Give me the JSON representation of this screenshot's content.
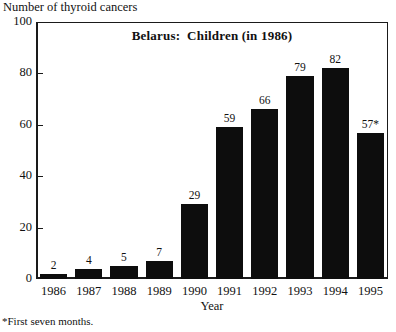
{
  "figure": {
    "y_axis_caption": "Number of thyroid cancers",
    "x_axis_title": "Year",
    "footnote": "*First seven months."
  },
  "chart_data": {
    "type": "bar",
    "title": "Belarus:  Children (in 1986)",
    "xlabel": "Year",
    "ylabel": "Number of thyroid cancers",
    "ylim": [
      0,
      100
    ],
    "yticks": [
      0,
      20,
      40,
      60,
      80,
      100
    ],
    "ytick_labels": [
      "0",
      "20",
      "40",
      "60",
      "80",
      "100"
    ],
    "grid": false,
    "legend": "none",
    "bar_color": "#0d0d0d",
    "categories": [
      "1986",
      "1987",
      "1988",
      "1989",
      "1990",
      "1991",
      "1992",
      "1993",
      "1994",
      "1995"
    ],
    "values": [
      2,
      4,
      5,
      7,
      29,
      59,
      66,
      79,
      82,
      57
    ],
    "data_labels": [
      "2",
      "4",
      "5",
      "7",
      "29",
      "59",
      "66",
      "79",
      "82",
      "57*"
    ],
    "annotations": [
      "*First seven months."
    ]
  }
}
